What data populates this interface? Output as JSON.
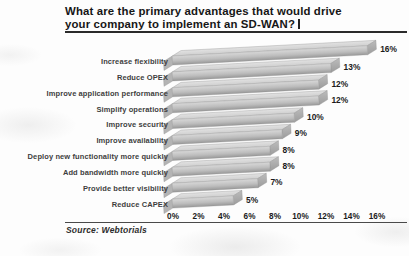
{
  "title": {
    "line1": "What are the primary advantages that would drive",
    "line2": "your company to implement an SD-WAN?"
  },
  "source": "Source: Webtorials",
  "chart_data": {
    "type": "bar",
    "orientation": "horizontal",
    "title": "What are the primary advantages that would drive your company to implement an SD-WAN?",
    "categories": [
      "Increase flexibility",
      "Reduce OPEX",
      "Improve application performance",
      "Simplify operations",
      "Improve security",
      "Improve availability",
      "Deploy new functionality more quickly",
      "Add bandwidth more quickly",
      "Provide better visibility",
      "Reduce CAPEX"
    ],
    "values": [
      16,
      13,
      12,
      12,
      10,
      9,
      8,
      8,
      7,
      5
    ],
    "value_labels": [
      "16%",
      "13%",
      "12%",
      "12%",
      "10%",
      "9%",
      "8%",
      "8%",
      "7%",
      "5%"
    ],
    "x_ticks": [
      "0%",
      "2%",
      "4%",
      "6%",
      "8%",
      "10%",
      "12%",
      "14%",
      "16%"
    ],
    "xlim": [
      0,
      16
    ],
    "xlabel": "",
    "ylabel": "",
    "grid": false,
    "legend": "none",
    "bar_style": "3d-silver",
    "colors": {
      "bar_top": "#e2e2e2",
      "bar_top_low": "#cfcfcf",
      "bar_front_hi": "#d8d8d8",
      "bar_front_mid": "#bdbdbd",
      "bar_front_low": "#989898",
      "bar_left_cap": "#b4b4b4",
      "bar_right_cap_hi": "#bcbcbc",
      "bar_right_cap_low": "#9c9c9c",
      "bar_outline": "#8d8d8d",
      "label_dark": "#1b1b1b",
      "category_text": "#3d3d3d"
    }
  }
}
